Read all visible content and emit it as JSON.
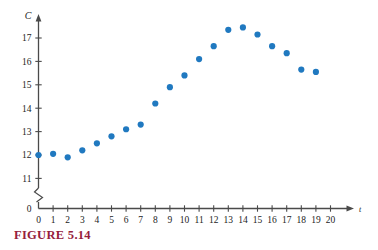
{
  "figure": {
    "caption": "FIGURE 5.14"
  },
  "colors": {
    "marker": "#2079c0",
    "axis": "#4a4a4a",
    "caption": "#96203c",
    "text": "#1c1c1c",
    "background": "#ffffff"
  },
  "chart_data": {
    "type": "scatter",
    "title": "",
    "subtitle": "",
    "xlabel": "t",
    "ylabel": "C",
    "xlim": [
      0,
      20
    ],
    "ylim": [
      11,
      17.8
    ],
    "y_axis_break": true,
    "y_axis_break_note": "axis broken between 0 and 11",
    "grid": false,
    "legend": null,
    "x_ticks": [
      0,
      1,
      2,
      3,
      4,
      5,
      6,
      7,
      8,
      9,
      10,
      11,
      12,
      13,
      14,
      15,
      16,
      17,
      18,
      19,
      20
    ],
    "x_tick_labels": [
      "0",
      "1",
      "2",
      "3",
      "4",
      "5",
      "6",
      "7",
      "8",
      "9",
      "10",
      "11",
      "12",
      "13",
      "14",
      "15",
      "16",
      "17",
      "18",
      "19",
      "20"
    ],
    "y_ticks": [
      0,
      11,
      12,
      13,
      14,
      15,
      16,
      17
    ],
    "y_tick_labels": [
      "0",
      "11",
      "12",
      "13",
      "14",
      "15",
      "16",
      "17"
    ],
    "x": [
      0,
      1,
      2,
      3,
      4,
      5,
      6,
      7,
      8,
      9,
      10,
      11,
      12,
      13,
      14,
      15,
      16,
      17,
      18,
      19
    ],
    "values": [
      12.0,
      12.05,
      11.9,
      12.2,
      12.5,
      12.8,
      13.1,
      13.3,
      14.2,
      14.9,
      15.4,
      16.1,
      16.65,
      17.35,
      17.45,
      17.15,
      16.65,
      16.35,
      15.65,
      15.55
    ],
    "points": [
      {
        "t": 0,
        "C": 12.0
      },
      {
        "t": 1,
        "C": 12.05
      },
      {
        "t": 2,
        "C": 11.9
      },
      {
        "t": 3,
        "C": 12.2
      },
      {
        "t": 4,
        "C": 12.5
      },
      {
        "t": 5,
        "C": 12.8
      },
      {
        "t": 6,
        "C": 13.1
      },
      {
        "t": 7,
        "C": 13.3
      },
      {
        "t": 8,
        "C": 14.2
      },
      {
        "t": 9,
        "C": 14.9
      },
      {
        "t": 10,
        "C": 15.4
      },
      {
        "t": 11,
        "C": 16.1
      },
      {
        "t": 12,
        "C": 16.65
      },
      {
        "t": 13,
        "C": 17.35
      },
      {
        "t": 14,
        "C": 17.45
      },
      {
        "t": 15,
        "C": 17.15
      },
      {
        "t": 16,
        "C": 16.65
      },
      {
        "t": 17,
        "C": 16.35
      },
      {
        "t": 18,
        "C": 15.65
      },
      {
        "t": 19,
        "C": 15.55
      }
    ]
  }
}
